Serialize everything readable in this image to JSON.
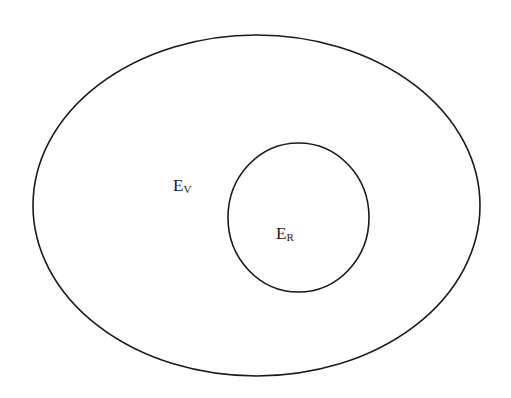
{
  "diagram": {
    "type": "nested-sets",
    "outer_set": {
      "label_main": "E",
      "label_sub": "V",
      "shape": "ellipse",
      "cx": 256.5,
      "cy": 205.5,
      "rx": 223.5,
      "ry": 170.5
    },
    "inner_set": {
      "label_main": "E",
      "label_sub": "R",
      "shape": "ellipse",
      "cx": 298.5,
      "cy": 217.5,
      "rx": 70.5,
      "ry": 74.5
    },
    "stroke_color": "#1a1a1a",
    "background": "#ffffff"
  }
}
